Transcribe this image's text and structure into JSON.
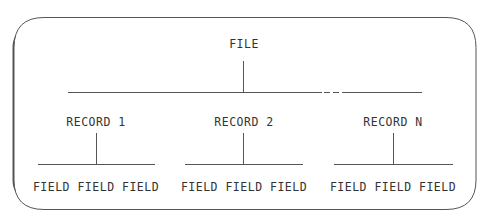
{
  "diagram": {
    "root": {
      "label": "FILE"
    },
    "records": [
      {
        "label": "RECORD 1",
        "fields": [
          "FIELD",
          "FIELD",
          "FIELD"
        ],
        "fields_text": "FIELD FIELD FIELD"
      },
      {
        "label": "RECORD 2",
        "fields": [
          "FIELD",
          "FIELD",
          "FIELD"
        ],
        "fields_text": "FIELD FIELD FIELD"
      },
      {
        "label": "RECORD N",
        "fields": [
          "FIELD",
          "FIELD",
          "FIELD"
        ],
        "fields_text": "FIELD FIELD FIELD"
      }
    ],
    "colors": {
      "line": "#555555",
      "text": "#333333",
      "background": "#ffffff"
    }
  }
}
